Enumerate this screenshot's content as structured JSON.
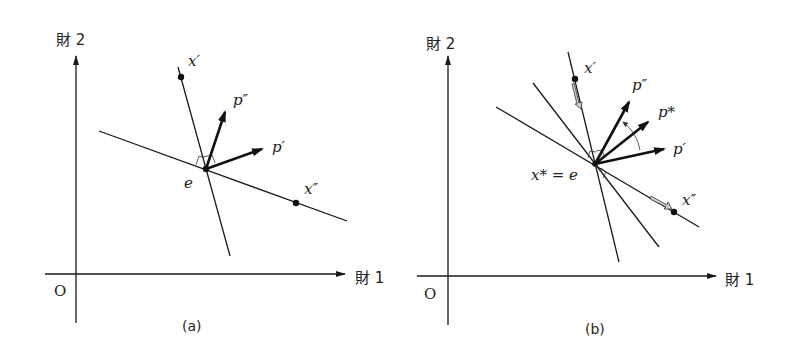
{
  "panels": [
    {
      "id": "a",
      "caption": "(a)",
      "axes": {
        "y_label": "財 2",
        "x_label": "財 1",
        "origin": "O"
      },
      "points": {
        "x_prime": {
          "label": "x′"
        },
        "x_double_prime": {
          "label": "x″"
        },
        "e": {
          "label": "e"
        }
      },
      "vectors": [
        {
          "label": "p″"
        },
        {
          "label": "p′"
        }
      ]
    },
    {
      "id": "b",
      "caption": "(b)",
      "axes": {
        "y_label": "財 2",
        "x_label": "財 1",
        "origin": "O"
      },
      "points": {
        "x_prime": {
          "label": "x′"
        },
        "x_double_prime": {
          "label": "x″"
        },
        "e": {
          "label": "x* = e"
        }
      },
      "vectors": [
        {
          "label": "p″"
        },
        {
          "label": "p*"
        },
        {
          "label": "p′"
        }
      ]
    }
  ],
  "colors": {
    "ink": "#1a1a1a",
    "hollow_arrow_fill": "#cfcfcf"
  }
}
